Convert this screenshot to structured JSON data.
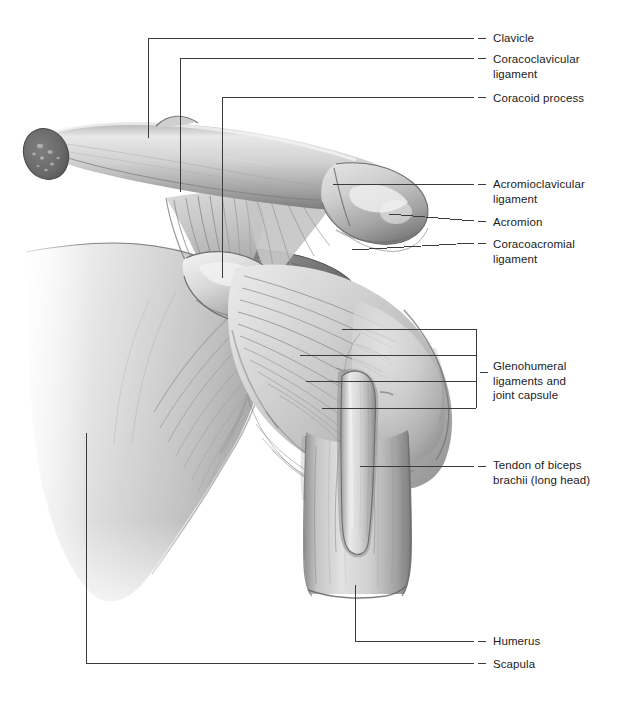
{
  "figure": {
    "kind": "anatomical-illustration",
    "style": "grayscale medical airbrush rendering with leader-line callouts",
    "background_color": "#ffffff",
    "line_color": "#3b3b3b",
    "text_color": "#1b1b1b",
    "palette": {
      "bone_light": "#f0f0f0",
      "bone_mid": "#bdbdbd",
      "bone_shadow": "#8d8d8d",
      "bone_dark": "#6b6b6b",
      "cut_surface": "#6e6e6e",
      "cut_surface_dark": "#575757",
      "ligament_light": "#d9d9d9",
      "ligament_mid": "#a8a8a8",
      "capsule_fiber": "#9a9a9a",
      "deep_shadow": "#5a5a5a"
    }
  },
  "labels": [
    {
      "id": "clavicle",
      "text": "Clavicle",
      "x": 493,
      "y": 31
    },
    {
      "id": "coracoclavicular-ligament",
      "text": "Coracoclavicular\nligament",
      "x": 493,
      "y": 52
    },
    {
      "id": "coracoid-process",
      "text": "Coracoid process",
      "x": 493,
      "y": 91
    },
    {
      "id": "acromioclavicular-ligament",
      "text": "Acromioclavicular\nligament",
      "x": 493,
      "y": 177
    },
    {
      "id": "acromion",
      "text": "Acromion",
      "x": 493,
      "y": 215
    },
    {
      "id": "coracoacromial-ligament",
      "text": "Coracoacromial\nligament",
      "x": 493,
      "y": 237
    },
    {
      "id": "glenohumeral-ligaments-and-joint-capsule",
      "text": "Glenohumeral\nligaments and\njoint capsule",
      "x": 493,
      "y": 359
    },
    {
      "id": "tendon-of-biceps-brachii",
      "text": "Tendon of biceps\nbrachii (long head)",
      "x": 493,
      "y": 458
    },
    {
      "id": "humerus",
      "text": "Humerus",
      "x": 493,
      "y": 634
    },
    {
      "id": "scapula",
      "text": "Scapula",
      "x": 493,
      "y": 657
    }
  ],
  "leader_dashes": [
    {
      "id": "dash-clavicle",
      "x": 478,
      "y": 38
    },
    {
      "id": "dash-coracoclavicular",
      "x": 478,
      "y": 58
    },
    {
      "id": "dash-coracoid",
      "x": 478,
      "y": 97
    },
    {
      "id": "dash-acromioclavicular",
      "x": 478,
      "y": 184
    },
    {
      "id": "dash-acromion",
      "x": 478,
      "y": 221
    },
    {
      "id": "dash-coracoacromial",
      "x": 478,
      "y": 243
    },
    {
      "id": "dash-glenohumeral",
      "x": 480,
      "y": 372
    },
    {
      "id": "dash-tendon",
      "x": 478,
      "y": 466
    },
    {
      "id": "dash-humerus",
      "x": 478,
      "y": 641
    },
    {
      "id": "dash-scapula",
      "x": 478,
      "y": 663
    }
  ],
  "leader_lines": [
    {
      "id": "leader-clavicle",
      "shape": "elbow",
      "points": "148,138 148,38 474,38"
    },
    {
      "id": "leader-coracoclavicular",
      "shape": "elbow",
      "points": "180,192 180,58 474,58"
    },
    {
      "id": "leader-coracoid",
      "shape": "elbow",
      "points": "222,278 222,97 474,97"
    },
    {
      "id": "leader-acromioclavicular",
      "shape": "line",
      "points": "333,184 474,184"
    },
    {
      "id": "leader-acromion",
      "shape": "line",
      "points": "389,214 474,221"
    },
    {
      "id": "leader-coracoacromial",
      "shape": "line",
      "points": "352,250 474,243"
    },
    {
      "id": "leader-glenohumeral-bracket",
      "shape": "bracket",
      "points": "342,329 476,329 476,408 322,408",
      "rails": "300,355 476,355 476,381 306,381"
    },
    {
      "id": "leader-tendon",
      "shape": "line",
      "points": "360,466 474,466"
    },
    {
      "id": "leader-humerus",
      "shape": "elbow",
      "points": "355,585 355,641 474,641"
    },
    {
      "id": "leader-scapula",
      "shape": "elbow",
      "points": "86,433 86,663 474,663"
    }
  ]
}
